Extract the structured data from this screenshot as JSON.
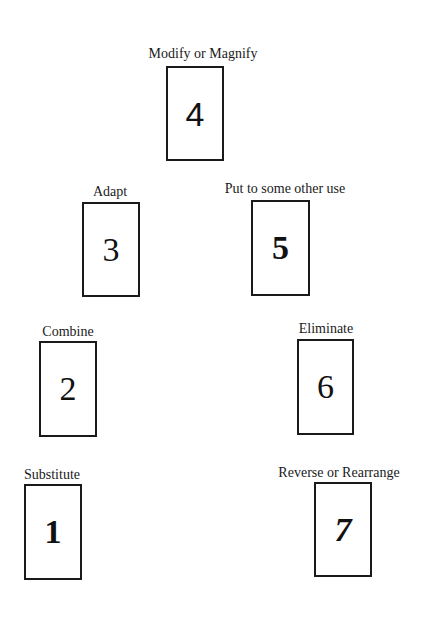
{
  "diagram": {
    "cards": [
      {
        "number": "1",
        "label": "Substitute"
      },
      {
        "number": "2",
        "label": "Combine"
      },
      {
        "number": "3",
        "label": "Adapt"
      },
      {
        "number": "4",
        "label": "Modify or Magnify"
      },
      {
        "number": "5",
        "label": "Put to some other use"
      },
      {
        "number": "6",
        "label": "Eliminate"
      },
      {
        "number": "7",
        "label": "Reverse or Rearrange"
      }
    ]
  },
  "colors": {
    "background": "#ffffff",
    "stroke": "#1a1a1a",
    "text": "#111111"
  }
}
